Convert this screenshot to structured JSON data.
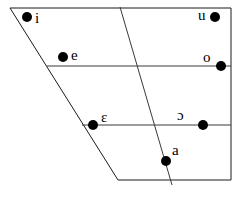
{
  "chart": {
    "type": "vowel-quadrilateral",
    "width": 239,
    "height": 197,
    "background_color": "#ffffff",
    "line_color": "#1a1a1a",
    "dot_color": "#000000",
    "outline": {
      "name": "vowel-trapezoid",
      "points": "10,8 231,8 231,180 118,180"
    },
    "height_lines": [
      {
        "name": "close-mid-line",
        "x1": 47,
        "y1": 66,
        "x2": 231,
        "y2": 66
      },
      {
        "name": "open-mid-line",
        "x1": 82,
        "y1": 125,
        "x2": 231,
        "y2": 125
      }
    ],
    "backness_lines": [
      {
        "name": "central-divider",
        "x1": 120,
        "y1": 7,
        "x2": 172,
        "y2": 185
      }
    ],
    "vowels": [
      {
        "symbol": "i",
        "name": "vowel-i",
        "dot_x": 27,
        "dot_y": 17,
        "label_x": 35,
        "label_y": 11,
        "label_side": "right"
      },
      {
        "symbol": "u",
        "name": "vowel-u",
        "dot_x": 215,
        "dot_y": 17,
        "label_x": 198,
        "label_y": 8,
        "label_side": "left"
      },
      {
        "symbol": "e",
        "name": "vowel-e",
        "dot_x": 63,
        "dot_y": 57,
        "label_x": 71,
        "label_y": 48,
        "label_side": "right"
      },
      {
        "symbol": "o",
        "name": "vowel-o",
        "dot_x": 221,
        "dot_y": 66,
        "label_x": 203,
        "label_y": 50,
        "label_side": "upper-left"
      },
      {
        "symbol": "ɛ",
        "name": "vowel-open-e",
        "dot_x": 93,
        "dot_y": 125,
        "label_x": 101,
        "label_y": 110,
        "label_side": "upper-right"
      },
      {
        "symbol": "ɔ",
        "name": "vowel-open-o",
        "dot_x": 203,
        "dot_y": 125,
        "label_x": 177,
        "label_y": 108,
        "label_side": "upper-left"
      },
      {
        "symbol": "a",
        "name": "vowel-a",
        "dot_x": 166,
        "dot_y": 161,
        "label_x": 172,
        "label_y": 143,
        "label_side": "upper-right"
      }
    ],
    "dot_radius": 5
  }
}
